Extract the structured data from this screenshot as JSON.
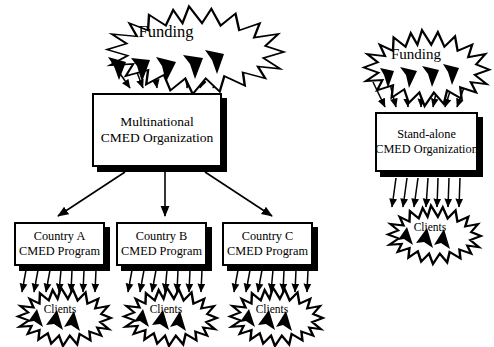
{
  "diagram": {
    "background_color": "#ffffff",
    "stroke_color": "#000000",
    "fill_color": "#ffffff",
    "type": "flow-diagram",
    "branches": [
      {
        "id": "multinational",
        "funding_label": "Funding",
        "organization": {
          "line1": "Multinational",
          "line2": "CMED Organization"
        },
        "programs": [
          {
            "line1": "Country A",
            "line2": "CMED Program",
            "clients_label": "Clients"
          },
          {
            "line1": "Country B",
            "line2": "CMED Program",
            "clients_label": "Clients"
          },
          {
            "line1": "Country C",
            "line2": "CMED Program",
            "clients_label": "Clients"
          }
        ]
      },
      {
        "id": "standalone",
        "funding_label": "Funding",
        "organization": {
          "line1": "Stand-alone",
          "line2": "CMED Organization"
        },
        "clients_label": "Clients"
      }
    ]
  },
  "labels": {
    "funding_left": "Funding",
    "funding_right": "Funding",
    "multinational_l1": "Multinational",
    "multinational_l2": "CMED Organization",
    "standalone_l1": "Stand-alone",
    "standalone_l2": "CMED Organization",
    "country_a_l1": "Country A",
    "country_a_l2": "CMED Program",
    "country_b_l1": "Country B",
    "country_b_l2": "CMED Program",
    "country_c_l1": "Country C",
    "country_c_l2": "CMED Program",
    "clients_a": "Clients",
    "clients_b": "Clients",
    "clients_c": "Clients",
    "clients_standalone": "Clients"
  }
}
